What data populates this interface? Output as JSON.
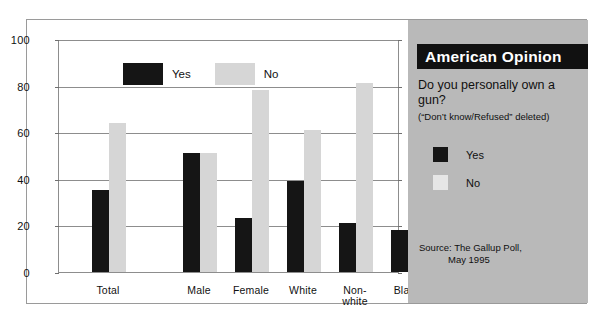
{
  "chart_data": {
    "type": "bar",
    "title": "",
    "xlabel": "",
    "ylabel": "",
    "ylim": [
      0,
      100
    ],
    "yticks": [
      0,
      20,
      40,
      60,
      80,
      100
    ],
    "grid": true,
    "legend_position": "inside-top-left",
    "categories": [
      "Total",
      "Male",
      "Female",
      "White",
      "Non-white",
      "Black"
    ],
    "series": [
      {
        "name": "Yes",
        "color": "#151515",
        "values": [
          35,
          51,
          23,
          39,
          21,
          18
        ]
      },
      {
        "name": "No",
        "color": "#d6d6d6",
        "values": [
          64,
          51,
          78,
          61,
          81,
          84
        ]
      }
    ]
  },
  "plot_legend": {
    "yes_label": "Yes",
    "no_label": "No"
  },
  "axis": {
    "tick_labels": [
      "100",
      "80",
      "60",
      "40",
      "20",
      "0"
    ]
  },
  "category_labels": [
    {
      "line1": "Total",
      "line2": ""
    },
    {
      "line1": "Male",
      "line2": ""
    },
    {
      "line1": "Female",
      "line2": ""
    },
    {
      "line1": "White",
      "line2": ""
    },
    {
      "line1": "Non-",
      "line2": "white"
    },
    {
      "line1": "Black",
      "line2": ""
    }
  ],
  "panel": {
    "title": "American Opinion",
    "question": "Do you personally own a gun?",
    "subnote": "(“Don’t know/Refused” deleted)",
    "legend": {
      "yes_label": "Yes",
      "no_label": "No"
    },
    "source_line1": "Source: The Gallup Poll,",
    "source_line2": "May 1995",
    "background_color": "#b9b9b9",
    "title_bar_color": "#111111"
  }
}
